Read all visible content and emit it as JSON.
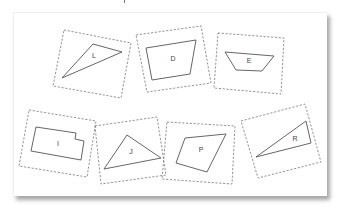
{
  "panel": {
    "background": "#ffffff",
    "shadow": "#9a9a9a"
  },
  "cards": [
    {
      "id": "L",
      "label": "L",
      "shape": "triangle",
      "border": "64,30 131,43 121,98 53,86",
      "outline": "93,44 122,52 62,78",
      "label_pos": [
        94,
        56
      ]
    },
    {
      "id": "D",
      "label": "D",
      "shape": "trapezoid",
      "border": "136,35 201,26 211,83 147,92",
      "outline": "146,48 196,40 190,74 152,80",
      "label_pos": [
        173,
        59
      ]
    },
    {
      "id": "E",
      "label": "E",
      "shape": "trapezoid",
      "border": "218,33 284,38 281,94 214,88",
      "outline": "225,52 274,56 262,71 236,70",
      "label_pos": [
        249,
        61
      ]
    },
    {
      "id": "I",
      "label": "I",
      "shape": "notched-rectangle",
      "border": "29,110 96,121 87,177 19,166",
      "outline": "36,127 76,133 75,139 84,141 81,160 31,151",
      "label_pos": [
        58,
        144
      ]
    },
    {
      "id": "J",
      "label": "J",
      "shape": "triangle",
      "border": "95,126 157,117 166,175 101,184",
      "outline": "127,135 161,158 104,169",
      "label_pos": [
        131,
        152
      ]
    },
    {
      "id": "P",
      "label": "P",
      "shape": "quadrilateral",
      "border": "167,122 235,126 232,184 162,179",
      "outline": "185,138 226,134 207,172 176,163",
      "label_pos": [
        201,
        150
      ]
    },
    {
      "id": "R",
      "label": "R",
      "shape": "triangle",
      "border": "241,121 305,104 321,162 258,178",
      "outline": "256,157 306,121 311,143",
      "label_pos": [
        295,
        139
      ]
    }
  ]
}
